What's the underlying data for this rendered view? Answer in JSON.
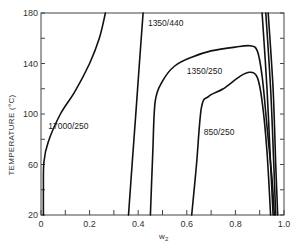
{
  "chart_data": {
    "type": "line",
    "title": "",
    "xlabel": "w₂",
    "ylabel": "TEMPERATURE (°C)",
    "xlim": [
      0,
      1.0
    ],
    "ylim": [
      20,
      180
    ],
    "grid": false,
    "legend": "none (inline curve labels)",
    "x_ticks": [
      "0",
      "0.2",
      "0.4",
      "0.6",
      "0.8",
      "1.0"
    ],
    "y_ticks": [
      "20",
      "60",
      "100",
      "140",
      "180"
    ],
    "series": [
      {
        "name": "17000/250",
        "label_pos": [
          0.03,
          88
        ],
        "points": [
          [
            0.01,
            20
          ],
          [
            0.01,
            40
          ],
          [
            0.012,
            62
          ],
          [
            0.03,
            78
          ],
          [
            0.08,
            100
          ],
          [
            0.14,
            118
          ],
          [
            0.2,
            140
          ],
          [
            0.24,
            160
          ],
          [
            0.265,
            180
          ]
        ]
      },
      {
        "name": "1350/440",
        "label_pos": [
          0.44,
          170
        ],
        "points": [
          [
            0.36,
            20
          ],
          [
            0.375,
            60
          ],
          [
            0.39,
            100
          ],
          [
            0.405,
            140
          ],
          [
            0.42,
            180
          ]
        ]
      },
      {
        "name": "1350/250",
        "label_pos": [
          0.6,
          132
        ],
        "points": [
          [
            0.45,
            20
          ],
          [
            0.46,
            70
          ],
          [
            0.47,
            110
          ],
          [
            0.5,
            126
          ],
          [
            0.55,
            138
          ],
          [
            0.62,
            145
          ],
          [
            0.7,
            150
          ],
          [
            0.8,
            153
          ],
          [
            0.86,
            154
          ],
          [
            0.89,
            150
          ],
          [
            0.91,
            130
          ],
          [
            0.93,
            90
          ],
          [
            0.95,
            50
          ],
          [
            0.96,
            20
          ]
        ]
      },
      {
        "name": "850/250",
        "label_pos": [
          0.67,
          83
        ],
        "points": [
          [
            0.62,
            20
          ],
          [
            0.64,
            60
          ],
          [
            0.66,
            105
          ],
          [
            0.69,
            114
          ],
          [
            0.75,
            120
          ],
          [
            0.82,
            130
          ],
          [
            0.86,
            133
          ],
          [
            0.89,
            129
          ],
          [
            0.91,
            110
          ],
          [
            0.93,
            70
          ],
          [
            0.945,
            20
          ]
        ]
      },
      {
        "name": "edge-1",
        "points": [
          [
            0.91,
            180
          ],
          [
            0.93,
            120
          ],
          [
            0.945,
            60
          ],
          [
            0.955,
            20
          ]
        ]
      },
      {
        "name": "edge-2",
        "points": [
          [
            0.925,
            180
          ],
          [
            0.945,
            120
          ],
          [
            0.958,
            60
          ],
          [
            0.966,
            20
          ]
        ]
      },
      {
        "name": "edge-3",
        "points": [
          [
            0.935,
            180
          ],
          [
            0.955,
            120
          ],
          [
            0.966,
            60
          ],
          [
            0.974,
            20
          ]
        ]
      }
    ]
  },
  "labels": {
    "ylabel": "TEMPERATURE (°C)",
    "xlabel_main": "w",
    "xlabel_sub": "2"
  }
}
